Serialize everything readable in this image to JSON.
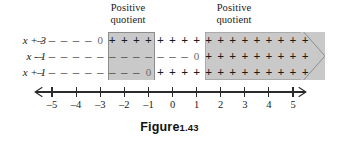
{
  "figure": {
    "caption_label": "Figure",
    "caption_number": "1.43"
  },
  "callouts": [
    {
      "name": "positive-quotient-left",
      "text": "Positive\nquotient"
    },
    {
      "name": "positive-quotient-right",
      "text": "Positive\nquotient"
    }
  ],
  "colors": {
    "band_fill": "#c9c9c9",
    "band_stroke": "#8d8d8d",
    "axis": "#2b2b2b",
    "text": "#1a1a1a"
  },
  "number_line": {
    "min": -5,
    "max": 5,
    "tick_labels": [
      "-5",
      "-4",
      "-3",
      "-2",
      "-1",
      "0",
      "1",
      "2",
      "3",
      "4",
      "5"
    ],
    "left_arrow": true,
    "right_arrow": true
  },
  "sign_chart": {
    "cell_positions": [
      -5.5,
      -4.5,
      -3.5,
      -3,
      -2.5,
      -2,
      -1.5,
      -1,
      -0.5,
      0,
      0.5,
      1,
      1.5,
      2,
      2.5,
      3,
      3.5,
      4,
      4.5,
      5,
      5.5
    ],
    "rows": [
      {
        "label": "x + 3",
        "zero_at": -3,
        "cells": [
          {
            "pos": -5.5,
            "sign": "-"
          },
          {
            "pos": -5,
            "sign": "-"
          },
          {
            "pos": -4.5,
            "sign": "-"
          },
          {
            "pos": -4,
            "sign": "-"
          },
          {
            "pos": -3.5,
            "sign": "-"
          },
          {
            "pos": -3,
            "sign": "0"
          },
          {
            "pos": -2.5,
            "sign": "+"
          },
          {
            "pos": -2,
            "sign": "+"
          },
          {
            "pos": -1.5,
            "sign": "+"
          },
          {
            "pos": -1,
            "sign": "+"
          },
          {
            "pos": -0.5,
            "sign": "+"
          },
          {
            "pos": 0,
            "sign": "+"
          },
          {
            "pos": 0.5,
            "sign": "+"
          },
          {
            "pos": 1,
            "sign": "+"
          },
          {
            "pos": 1.5,
            "sign": "+"
          },
          {
            "pos": 2,
            "sign": "+"
          },
          {
            "pos": 2.5,
            "sign": "+"
          },
          {
            "pos": 3,
            "sign": "+"
          },
          {
            "pos": 3.5,
            "sign": "+"
          },
          {
            "pos": 4,
            "sign": "+"
          },
          {
            "pos": 4.5,
            "sign": "+"
          },
          {
            "pos": 5,
            "sign": "+"
          },
          {
            "pos": 5.5,
            "sign": "+"
          }
        ]
      },
      {
        "label": "x - 1",
        "zero_at": 1,
        "cells": [
          {
            "pos": -5.5,
            "sign": "-"
          },
          {
            "pos": -5,
            "sign": "-"
          },
          {
            "pos": -4.5,
            "sign": "-"
          },
          {
            "pos": -4,
            "sign": "-"
          },
          {
            "pos": -3.5,
            "sign": "-"
          },
          {
            "pos": -3,
            "sign": "-"
          },
          {
            "pos": -2.5,
            "sign": "-"
          },
          {
            "pos": -2,
            "sign": "-"
          },
          {
            "pos": -1.5,
            "sign": "-"
          },
          {
            "pos": -1,
            "sign": "-"
          },
          {
            "pos": -0.5,
            "sign": "-"
          },
          {
            "pos": 0,
            "sign": "-"
          },
          {
            "pos": 0.5,
            "sign": "-"
          },
          {
            "pos": 1,
            "sign": "0"
          },
          {
            "pos": 1.5,
            "sign": "+"
          },
          {
            "pos": 2,
            "sign": "+"
          },
          {
            "pos": 2.5,
            "sign": "+"
          },
          {
            "pos": 3,
            "sign": "+"
          },
          {
            "pos": 3.5,
            "sign": "+"
          },
          {
            "pos": 4,
            "sign": "+"
          },
          {
            "pos": 4.5,
            "sign": "+"
          },
          {
            "pos": 5,
            "sign": "+"
          },
          {
            "pos": 5.5,
            "sign": "+"
          }
        ]
      },
      {
        "label": "x + 1",
        "zero_at": -1,
        "cells": [
          {
            "pos": -5.5,
            "sign": "-"
          },
          {
            "pos": -5,
            "sign": "-"
          },
          {
            "pos": -4.5,
            "sign": "-"
          },
          {
            "pos": -4,
            "sign": "-"
          },
          {
            "pos": -3.5,
            "sign": "-"
          },
          {
            "pos": -3,
            "sign": "-"
          },
          {
            "pos": -2.5,
            "sign": "-"
          },
          {
            "pos": -2,
            "sign": "-"
          },
          {
            "pos": -1.5,
            "sign": "-"
          },
          {
            "pos": -1,
            "sign": "0"
          },
          {
            "pos": -0.5,
            "sign": "+"
          },
          {
            "pos": 0,
            "sign": "+"
          },
          {
            "pos": 0.5,
            "sign": "+"
          },
          {
            "pos": 1,
            "sign": "+"
          },
          {
            "pos": 1.5,
            "sign": "+"
          },
          {
            "pos": 2,
            "sign": "+"
          },
          {
            "pos": 2.5,
            "sign": "+"
          },
          {
            "pos": 3,
            "sign": "+"
          },
          {
            "pos": 3.5,
            "sign": "+"
          },
          {
            "pos": 4,
            "sign": "+"
          },
          {
            "pos": 4.5,
            "sign": "+"
          },
          {
            "pos": 5,
            "sign": "+"
          },
          {
            "pos": 5.5,
            "sign": "+"
          }
        ]
      }
    ],
    "shaded_intervals": [
      {
        "name": "interval-left",
        "from": -3,
        "to": -1,
        "arrow": false
      },
      {
        "name": "interval-right",
        "from": 1,
        "to": 5.8,
        "arrow": true
      }
    ]
  }
}
